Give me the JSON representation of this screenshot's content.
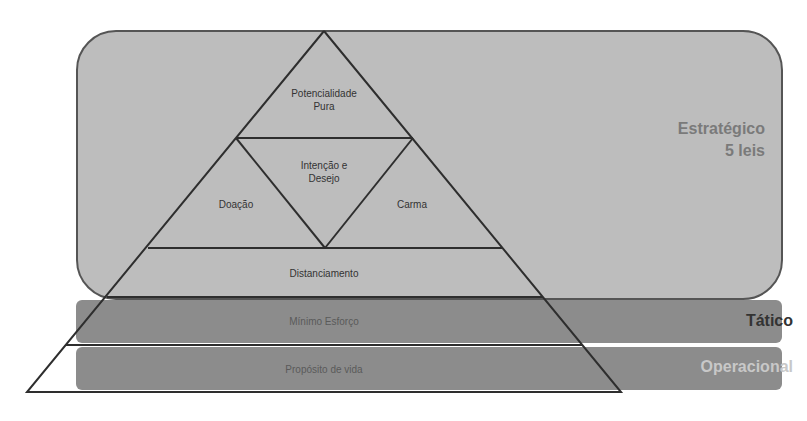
{
  "levels": {
    "strategic": {
      "title": "Estratégico",
      "subtitle": "5 leis",
      "color": "#bdbdbd"
    },
    "tactical": {
      "title": "Tático",
      "color": "#8c8c8c"
    },
    "operational": {
      "title": "Operacional",
      "color": "#8c8c8c"
    }
  },
  "pyramid": {
    "apex": {
      "line1": "Potencialidade",
      "line2": "Pura"
    },
    "center": {
      "line1": "Intenção e",
      "line2": "Desejo"
    },
    "left": "Doação",
    "right": "Carma",
    "band1": "Distanciamento",
    "band2": "Mínimo Esforço",
    "band3": "Propósito de vida"
  }
}
